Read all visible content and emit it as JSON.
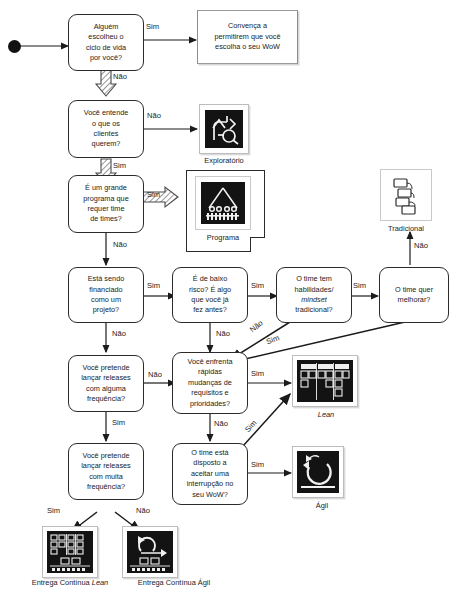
{
  "diagram": {
    "language": "pt-BR",
    "start_node": "start-dot"
  },
  "labels": {
    "sim": "Sim",
    "nao": "Não"
  },
  "nodes": {
    "q_lifecycle": {
      "lines": [
        "Alguém",
        "escolheu o",
        "ciclo de vida",
        "por você?"
      ]
    },
    "a_convince": {
      "lines": [
        "Convença a",
        "permitirem que você",
        "escolha o seu WoW"
      ]
    },
    "q_customers": {
      "lines": [
        "Você entende",
        "o que os",
        "clientes",
        "querem?"
      ]
    },
    "q_program": {
      "lines": [
        "É um grande",
        "programa que",
        "requer time",
        "de times?"
      ]
    },
    "q_funded": {
      "lines": [
        "Está sendo",
        "financiado",
        "como um",
        "projeto?"
      ]
    },
    "q_lowrisk": {
      "lines": [
        "É de baixo",
        "risco? É algo",
        "que você já",
        "fez antes?"
      ]
    },
    "q_skills": {
      "lines": [
        "O time tem",
        "habilidades/",
        "mindset",
        "tradicional?"
      ],
      "italic_line": 2
    },
    "q_improve": {
      "lines": [
        "O time quer",
        "melhorar?"
      ]
    },
    "q_some_releases": {
      "lines": [
        "Você pretende",
        "lançar releases",
        "com alguma",
        "frequência?"
      ]
    },
    "q_fast_change": {
      "lines": [
        "Você enfrenta",
        "rápidas",
        "mudanças de",
        "requisitos e",
        "prioridades?"
      ]
    },
    "q_many_releases": {
      "lines": [
        "Você pretende",
        "lançar releases",
        "com muita",
        "frequência?"
      ]
    },
    "q_interrupt": {
      "lines": [
        "O time está",
        "disposto a",
        "aceitar uma",
        "interrupção no",
        "seu WoW?"
      ]
    }
  },
  "artifacts": {
    "exploratorio": {
      "caption": "Exploratório",
      "icon": "exploratory-arrows-icon"
    },
    "programa": {
      "caption": "Programa",
      "icon": "program-teams-icon"
    },
    "tradicional": {
      "caption": "Tradicional",
      "icon": "gantt-cascade-icon"
    },
    "lean": {
      "caption": "Lean",
      "caption_italic": true,
      "icon": "kanban-board-icon"
    },
    "agil": {
      "caption": "Ágil",
      "icon": "cycle-loop-icon"
    },
    "entrega_continua_lean": {
      "caption_plain": "Entrega Contínua ",
      "caption_italic_part": "Lean",
      "icon": "continuous-delivery-lean-icon"
    },
    "entrega_continua_agil": {
      "caption_plain": "Entrega Contínua Ágil",
      "icon": "continuous-delivery-agile-icon"
    }
  },
  "edges": [
    {
      "id": "e-lifecycle-sim",
      "label": "Sim",
      "x": 146,
      "y": 17
    },
    {
      "id": "e-lifecycle-nao",
      "label": "Não",
      "x": 118,
      "y": 68
    },
    {
      "id": "e-customers-nao",
      "label": "Não",
      "x": 150,
      "y": 106
    },
    {
      "id": "e-customers-sim",
      "label": "Sim",
      "x": 118,
      "y": 157
    },
    {
      "id": "e-program-sim",
      "label": "Sim",
      "x": 150,
      "y": 190
    },
    {
      "id": "e-program-nao",
      "label": "Não",
      "x": 118,
      "y": 243
    },
    {
      "id": "e-funded-sim",
      "label": "Sim",
      "x": 148,
      "y": 275
    },
    {
      "id": "e-funded-nao",
      "label": "Não",
      "x": 113,
      "y": 330
    },
    {
      "id": "e-lowrisk-sim",
      "label": "Sim",
      "x": 251,
      "y": 275
    },
    {
      "id": "e-lowrisk-nao",
      "label": "Não",
      "x": 216,
      "y": 330
    },
    {
      "id": "e-skills-sim",
      "label": "Sim",
      "x": 353,
      "y": 275
    },
    {
      "id": "e-skills-nao",
      "label": "Não",
      "x": 249,
      "y": 328
    },
    {
      "id": "e-improve-nao",
      "label": "Não",
      "x": 415,
      "y": 243
    },
    {
      "id": "e-improve-sim",
      "label": "Sim",
      "x": 268,
      "y": 335
    },
    {
      "id": "e-some-nao",
      "label": "Não",
      "x": 149,
      "y": 366
    },
    {
      "id": "e-some-sim",
      "label": "Sim",
      "x": 113,
      "y": 420
    },
    {
      "id": "e-fastchange-sim",
      "label": "Sim",
      "x": 250,
      "y": 365
    },
    {
      "id": "e-fastchange-nao",
      "label": "Não",
      "x": 213,
      "y": 420
    },
    {
      "id": "e-interrupt-sim",
      "label": "Sim",
      "x": 250,
      "y": 455
    },
    {
      "id": "e-interrupt-simlean",
      "label": "Sim",
      "x": 245,
      "y": 420
    },
    {
      "id": "e-many-sim",
      "label": "Sim",
      "x": 48,
      "y": 502
    },
    {
      "id": "e-many-nao",
      "label": "Não",
      "x": 135,
      "y": 502
    }
  ],
  "colors": {
    "ink": "#1b1b1b",
    "box_stroke": "#2b2b2b",
    "soft_stroke": "#9a9a9a",
    "icon_dark": "#111111",
    "page_bg": "#ffffff"
  }
}
